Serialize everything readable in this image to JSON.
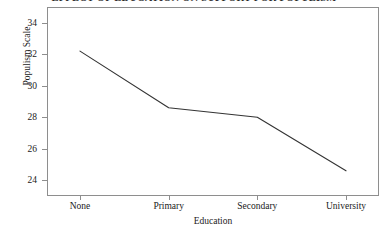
{
  "chart_data": {
    "type": "line",
    "title": "EFFECT OF EDUCATION ON SUPPORT FOR POPULISM",
    "xlabel": "Education",
    "ylabel": "Populism Scale",
    "categories": [
      "None",
      "Primary",
      "Secondary",
      "University"
    ],
    "values": [
      32.2,
      28.6,
      28.0,
      24.6
    ],
    "series": [
      {
        "name": "Populism Scale",
        "values": [
          32.2,
          28.6,
          28.0,
          24.6
        ]
      }
    ],
    "ylim": [
      23.0,
      35.0
    ],
    "yticks": [
      24,
      26,
      28,
      30,
      32,
      34
    ],
    "ytick_labels": [
      "24",
      "26",
      "28",
      "30",
      "32",
      "34"
    ],
    "xticks": [
      0,
      1,
      2,
      3
    ],
    "grid": false,
    "legend": false,
    "legend_position": "none",
    "line_color": "#333333",
    "frame_color": "#8e8e8e",
    "background": "#ffffff"
  }
}
